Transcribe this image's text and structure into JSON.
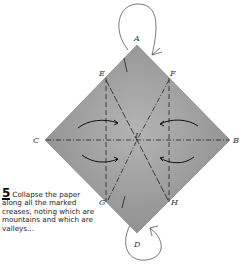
{
  "diagram": {
    "type": "origami-folding-step",
    "paper_color": "#9a9a9a",
    "line_color": "#2a2a2a",
    "points": {
      "A": "A",
      "B": "B",
      "C": "C",
      "D": "D",
      "E": "E",
      "F": "F",
      "G": "G",
      "H": "H",
      "I": "I"
    },
    "crease_types": [
      "mountain (dash-dot)",
      "valley (dashed)"
    ]
  },
  "caption": {
    "step_number": "5",
    "text": "Collapse the paper along all the marked creases, noting which are mountains and which are valleys..."
  }
}
